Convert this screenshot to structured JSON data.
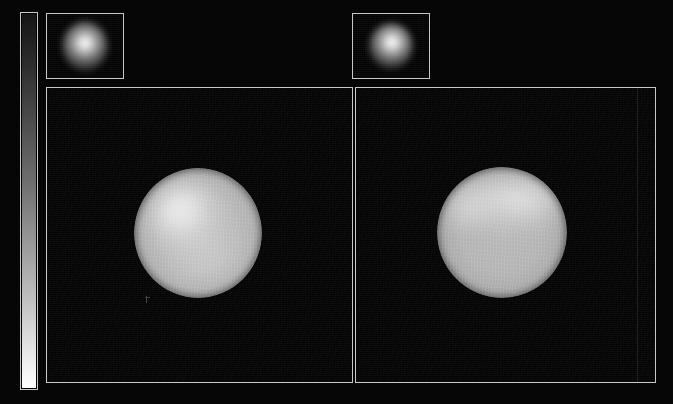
{
  "figure": {
    "background_color": "#050505",
    "frame_color": "#c8c8c8",
    "width": 673,
    "height": 404,
    "title": "",
    "caption": ""
  },
  "colorbar": {
    "name": "intensity-colorbar",
    "orientation": "vertical",
    "colormap": "grayscale",
    "low_color": "#0a0a0a",
    "high_color": "#ffffff",
    "low_label": "",
    "high_label": "",
    "tick_labels": [],
    "stops": [
      {
        "position": 0,
        "color": "#141414"
      },
      {
        "position": 12,
        "color": "#2a2a2a"
      },
      {
        "position": 28,
        "color": "#4a4a4a"
      },
      {
        "position": 45,
        "color": "#6e6e6e"
      },
      {
        "position": 62,
        "color": "#9a9a9a"
      },
      {
        "position": 78,
        "color": "#c4c4c4"
      },
      {
        "position": 90,
        "color": "#e6e6e6"
      },
      {
        "position": 100,
        "color": "#ffffff"
      }
    ]
  },
  "panels": [
    {
      "id": "left",
      "name": "reconstructed-image-left",
      "label": "",
      "inset": {
        "name": "beam-inset-left",
        "label": "",
        "content": "point-spread-function",
        "peak_color": "#ffffff",
        "background_color": "#030303"
      },
      "object": {
        "name": "stellar-disc-left",
        "shape": "sphere",
        "hotspot_position": "upper-left",
        "peak_brightness_color": "#ffffff",
        "mean_disc_color": "#bebebe",
        "limb_color": "#5a5a5a"
      },
      "marker": {
        "name": "scale-marker-left",
        "label": ""
      }
    },
    {
      "id": "right",
      "name": "reconstructed-image-right",
      "label": "",
      "inset": {
        "name": "beam-inset-right",
        "label": "",
        "content": "point-spread-function",
        "peak_color": "#ffffff",
        "background_color": "#030303"
      },
      "object": {
        "name": "stellar-disc-right",
        "shape": "sphere",
        "hotspot_position": "upper-right-limb",
        "peak_brightness_color": "#ffffff",
        "mean_disc_color": "#b8b8b8",
        "limb_color": "#565656"
      },
      "marker": null
    }
  ],
  "chart_data": {
    "type": "heatmap",
    "title": "",
    "subtitle": "",
    "xlabel": "",
    "ylabel": "",
    "grid": false,
    "legend_position": "left",
    "colormap": "grayscale",
    "colorbar_range": [
      0,
      1
    ],
    "colorbar_ticks": [],
    "panel_count": 2,
    "annotations": [],
    "panels": [
      {
        "name": "reconstructed-image-left",
        "field": "surface-brightness",
        "value_range": [
          0,
          1
        ],
        "background_level": 0.02,
        "disc": {
          "center_x": 0.49,
          "center_y": 0.49,
          "radius_fraction": 0.215,
          "mean_value": 0.74,
          "peak_value": 1.0,
          "peak_x": 0.41,
          "peak_y": 0.4,
          "limb_value": 0.35
        },
        "inset": {
          "name": "beam-inset-left",
          "field": "point-spread-function",
          "peak_value": 1.0,
          "fwhm_fraction": 0.38
        }
      },
      {
        "name": "reconstructed-image-right",
        "field": "surface-brightness",
        "value_range": [
          0,
          1
        ],
        "background_level": 0.02,
        "disc": {
          "center_x": 0.485,
          "center_y": 0.49,
          "radius_fraction": 0.222,
          "mean_value": 0.72,
          "peak_value": 0.95,
          "peak_x": 0.56,
          "peak_y": 0.3,
          "limb_value": 0.34
        },
        "inset": {
          "name": "beam-inset-right",
          "field": "point-spread-function",
          "peak_value": 1.0,
          "fwhm_fraction": 0.36
        }
      }
    ]
  }
}
